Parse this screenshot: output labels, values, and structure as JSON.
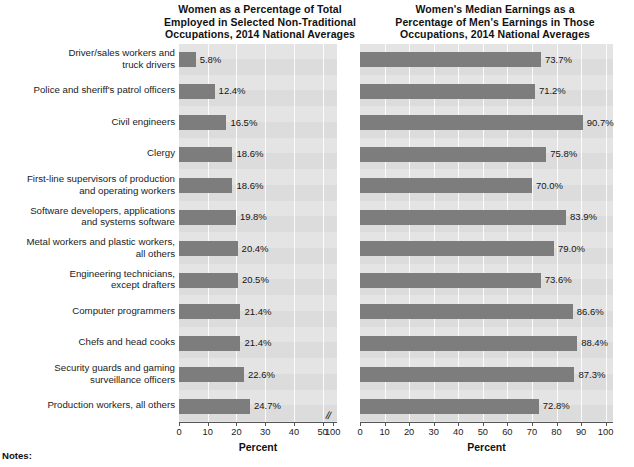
{
  "left_chart": {
    "title": "Women as a Percentage of Total\nEmployed in Selected Non-Traditional\nOccupations, 2014 National Averages",
    "axis_label": "Percent",
    "ticks": [
      "0",
      "10",
      "20",
      "30",
      "40",
      "50",
      "100"
    ],
    "break_mark": "//"
  },
  "right_chart": {
    "title": "Women's Median Earnings as a\nPercentage of Men's Earnings in Those\nOccupations, 2014 National Averages",
    "axis_label": "Percent",
    "ticks": [
      "0",
      "10",
      "20",
      "30",
      "40",
      "50",
      "60",
      "70",
      "80",
      "90",
      "100"
    ]
  },
  "notes_label": "Notes:",
  "colors": {
    "bar": "#7d7d7d",
    "plot_background": "#e4e4e4",
    "band": "#d2d2d2",
    "gridline": "#fbfbfb",
    "text": "#1a1a1a"
  },
  "chart_data": [
    {
      "type": "bar",
      "orientation": "horizontal",
      "title": "Women as a Percentage of Total Employed in Selected Non-Traditional Occupations, 2014 National Averages",
      "xlabel": "Percent",
      "ylabel": "",
      "xlim": [
        0,
        55
      ],
      "axis_break": true,
      "axis_break_note": "Axis is broken after 50; final tick shown is 100",
      "grid": true,
      "legend": "none",
      "categories": [
        "Driver/sales workers and truck drivers",
        "Police and sheriff's patrol officers",
        "Civil engineers",
        "Clergy",
        "First-line supervisors of production and operating workers",
        "Software developers, applications and systems software",
        "Metal workers and plastic workers, all others",
        "Engineering technicians, except drafters",
        "Computer programmers",
        "Chefs and head cooks",
        "Security guards and gaming surveillance officers",
        "Production workers, all others"
      ],
      "values": [
        5.8,
        12.4,
        16.5,
        18.6,
        18.6,
        19.8,
        20.4,
        20.5,
        21.4,
        21.4,
        22.6,
        24.7
      ],
      "data_labels": [
        "5.8%",
        "12.4%",
        "16.5%",
        "18.6%",
        "18.6%",
        "19.8%",
        "20.4%",
        "20.5%",
        "21.4%",
        "21.4%",
        "22.6%",
        "24.7%"
      ]
    },
    {
      "type": "bar",
      "orientation": "horizontal",
      "title": "Women's Median Earnings as a Percentage of Men's Earnings in Those Occupations, 2014 National Averages",
      "xlabel": "Percent",
      "ylabel": "",
      "xlim": [
        0,
        100
      ],
      "grid": true,
      "legend": "none",
      "categories": [
        "Driver/sales workers and truck drivers",
        "Police and sheriff's patrol officers",
        "Civil engineers",
        "Clergy",
        "First-line supervisors of production and operating workers",
        "Software developers, applications and systems software",
        "Metal workers and plastic workers, all others",
        "Engineering technicians, except drafters",
        "Computer programmers",
        "Chefs and head cooks",
        "Security guards and gaming surveillance officers",
        "Production workers, all others"
      ],
      "values": [
        73.7,
        71.2,
        90.7,
        75.8,
        70.0,
        83.9,
        79.0,
        73.6,
        86.6,
        88.4,
        87.3,
        72.8
      ],
      "data_labels": [
        "73.7%",
        "71.2%",
        "90.7%",
        "75.8%",
        "70.0%",
        "83.9%",
        "79.0%",
        "73.6%",
        "86.6%",
        "88.4%",
        "87.3%",
        "72.8%"
      ]
    }
  ],
  "category_label_lines": [
    [
      "Driver/sales workers and",
      "truck drivers"
    ],
    [
      "Police and sheriff's patrol officers"
    ],
    [
      "Civil engineers"
    ],
    [
      "Clergy"
    ],
    [
      "First-line supervisors of production",
      "and operating workers"
    ],
    [
      "Software developers, applications",
      "and systems software"
    ],
    [
      "Metal workers and plastic workers,",
      "all others"
    ],
    [
      "Engineering technicians,",
      "except drafters"
    ],
    [
      "Computer programmers"
    ],
    [
      "Chefs and head cooks"
    ],
    [
      "Security guards and gaming",
      "surveillance officers"
    ],
    [
      "Production workers, all others"
    ]
  ]
}
